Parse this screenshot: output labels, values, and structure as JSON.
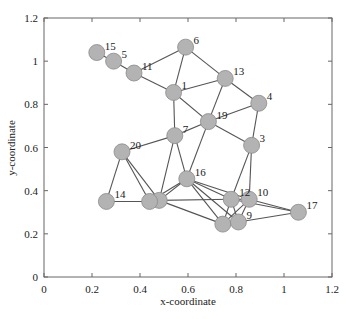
{
  "chart_data": {
    "type": "scatter",
    "subtype": "network-graph",
    "title": "",
    "xlabel": "x-coordinate",
    "ylabel": "y-coordinate",
    "xlim": [
      0,
      1.2
    ],
    "ylim": [
      0,
      1.2
    ],
    "xticks": [
      "0",
      "0.2",
      "0.4",
      "0.6",
      "0.8",
      "1",
      "1.2"
    ],
    "yticks": [
      "0",
      "0.2",
      "0.4",
      "0.6",
      "0.8",
      "1",
      "1.2"
    ],
    "grid": false,
    "legend": null,
    "colors": {
      "node_fill": "#b3b3b3",
      "node_stroke": "#8a8a8a",
      "edge": "#555555",
      "axis": "#666666"
    },
    "nodes": [
      {
        "id": "1",
        "x": 0.54,
        "y": 0.855
      },
      {
        "id": "2",
        "x": 0.48,
        "y": 0.355
      },
      {
        "id": "3",
        "x": 0.865,
        "y": 0.61
      },
      {
        "id": "4",
        "x": 0.895,
        "y": 0.805
      },
      {
        "id": "5",
        "x": 0.29,
        "y": 1.0
      },
      {
        "id": "6",
        "x": 0.59,
        "y": 1.065
      },
      {
        "id": "7",
        "x": 0.545,
        "y": 0.655
      },
      {
        "id": "8",
        "x": 0.745,
        "y": 0.245
      },
      {
        "id": "9",
        "x": 0.81,
        "y": 0.255
      },
      {
        "id": "10",
        "x": 0.855,
        "y": 0.36
      },
      {
        "id": "11",
        "x": 0.375,
        "y": 0.945
      },
      {
        "id": "12",
        "x": 0.78,
        "y": 0.36
      },
      {
        "id": "13",
        "x": 0.755,
        "y": 0.92
      },
      {
        "id": "14",
        "x": 0.26,
        "y": 0.35
      },
      {
        "id": "15",
        "x": 0.22,
        "y": 1.04
      },
      {
        "id": "16",
        "x": 0.595,
        "y": 0.455
      },
      {
        "id": "17",
        "x": 1.06,
        "y": 0.3
      },
      {
        "id": "18",
        "x": 0.44,
        "y": 0.35
      },
      {
        "id": "19",
        "x": 0.685,
        "y": 0.72
      },
      {
        "id": "20",
        "x": 0.325,
        "y": 0.58
      }
    ],
    "visible_labels": [
      "1",
      "3",
      "4",
      "5",
      "6",
      "7",
      "9",
      "10",
      "11",
      "12",
      "13",
      "14",
      "15",
      "16",
      "17",
      "19",
      "20"
    ],
    "edges": [
      [
        "15",
        "5"
      ],
      [
        "5",
        "11"
      ],
      [
        "11",
        "6"
      ],
      [
        "11",
        "1"
      ],
      [
        "6",
        "1"
      ],
      [
        "6",
        "13"
      ],
      [
        "1",
        "13"
      ],
      [
        "1",
        "19"
      ],
      [
        "1",
        "7"
      ],
      [
        "13",
        "4"
      ],
      [
        "13",
        "19"
      ],
      [
        "4",
        "19"
      ],
      [
        "4",
        "3"
      ],
      [
        "19",
        "7"
      ],
      [
        "19",
        "3"
      ],
      [
        "19",
        "16"
      ],
      [
        "7",
        "20"
      ],
      [
        "7",
        "16"
      ],
      [
        "7",
        "2"
      ],
      [
        "20",
        "14"
      ],
      [
        "20",
        "18"
      ],
      [
        "20",
        "2"
      ],
      [
        "14",
        "18"
      ],
      [
        "18",
        "2"
      ],
      [
        "16",
        "2"
      ],
      [
        "16",
        "18"
      ],
      [
        "16",
        "12"
      ],
      [
        "16",
        "10"
      ],
      [
        "16",
        "8"
      ],
      [
        "16",
        "9"
      ],
      [
        "2",
        "12"
      ],
      [
        "2",
        "8"
      ],
      [
        "3",
        "12"
      ],
      [
        "3",
        "10"
      ],
      [
        "12",
        "10"
      ],
      [
        "12",
        "8"
      ],
      [
        "12",
        "9"
      ],
      [
        "12",
        "17"
      ],
      [
        "10",
        "8"
      ],
      [
        "10",
        "9"
      ],
      [
        "10",
        "17"
      ],
      [
        "8",
        "9"
      ],
      [
        "9",
        "17"
      ]
    ]
  }
}
